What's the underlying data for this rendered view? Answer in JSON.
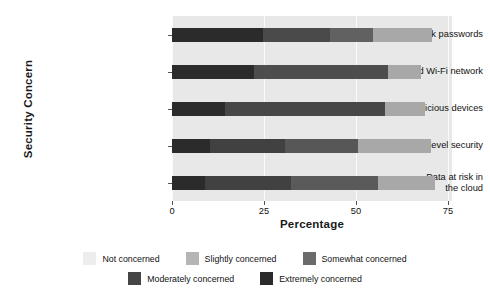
{
  "chart_data": {
    "type": "bar",
    "orientation": "horizontal",
    "stacked": true,
    "title": "",
    "xlabel": "Percentage",
    "ylabel": "Security Concern",
    "categories": [
      "Weak passwords",
      "Unsecured Wi-Fi network",
      "Malicious devices",
      "Lack of transport-level security",
      "Data at risk in\nthe cloud"
    ],
    "xlim": [
      -2,
      78
    ],
    "xticks": [
      0,
      25,
      50,
      75
    ],
    "xtick_labels": [
      "0",
      "25",
      "50",
      "75"
    ],
    "grid": true,
    "legend_position": "bottom",
    "series": [
      {
        "name": "Extremely concerned",
        "color": "#2b2b2b",
        "values": [
          24.7,
          22.3,
          14.4,
          10.3,
          9.0
        ]
      },
      {
        "name": "Moderately concerned",
        "color": "#4a4a4a",
        "values": [
          18.2,
          36.4,
          43.5,
          20.4,
          23.4
        ]
      },
      {
        "name": "Somewhat concerned",
        "color": "#6e6e6e",
        "values": [
          11.7,
          0.0,
          0.0,
          19.8,
          23.6
        ]
      },
      {
        "name": "Slightly concerned",
        "color": "#a8a8a8",
        "values": [
          16.0,
          9.0,
          10.9,
          19.8,
          15.5
        ]
      },
      {
        "name": "Not concerned",
        "color": "#ededed",
        "values": [
          0.0,
          0.0,
          0.0,
          0.0,
          0.0
        ]
      }
    ],
    "bars": [
      {
        "category": "Weak passwords",
        "segments": [
          {
            "name": "Extremely concerned",
            "value": 24.7,
            "color": "#2b2b2b"
          },
          {
            "name": "Moderately concerned",
            "value": 18.2,
            "color": "#4a4a4a"
          },
          {
            "name": "Somewhat concerned",
            "value": 11.7,
            "color": "#616161"
          },
          {
            "name": "Slightly concerned",
            "value": 16.0,
            "color": "#a8a8a8"
          }
        ]
      },
      {
        "category": "Unsecured Wi-Fi network",
        "segments": [
          {
            "name": "Extremely concerned",
            "value": 22.3,
            "color": "#2b2b2b"
          },
          {
            "name": "Moderately concerned",
            "value": 36.4,
            "color": "#4d4d4d"
          },
          {
            "name": "Slightly concerned",
            "value": 9.0,
            "color": "#a8a8a8"
          }
        ]
      },
      {
        "category": "Malicious devices",
        "segments": [
          {
            "name": "Extremely concerned",
            "value": 14.4,
            "color": "#2b2b2b"
          },
          {
            "name": "Moderately concerned",
            "value": 43.5,
            "color": "#474747"
          },
          {
            "name": "Slightly concerned",
            "value": 10.9,
            "color": "#a8a8a8"
          }
        ]
      },
      {
        "category": "Lack of transport-level security",
        "segments": [
          {
            "name": "Extremely concerned",
            "value": 10.3,
            "color": "#2b2b2b"
          },
          {
            "name": "Moderately concerned",
            "value": 20.4,
            "color": "#414141"
          },
          {
            "name": "Somewhat concerned",
            "value": 19.8,
            "color": "#575757"
          },
          {
            "name": "Slightly concerned",
            "value": 19.8,
            "color": "#a8a8a8"
          }
        ]
      },
      {
        "category": "Data at risk in the cloud",
        "segments": [
          {
            "name": "Extremely concerned",
            "value": 9.0,
            "color": "#2b2b2b"
          },
          {
            "name": "Moderately concerned",
            "value": 23.4,
            "color": "#414141"
          },
          {
            "name": "Somewhat concerned",
            "value": 23.6,
            "color": "#5a5a5a"
          },
          {
            "name": "Slightly concerned",
            "value": 15.5,
            "color": "#a8a8a8"
          }
        ]
      }
    ],
    "legend": [
      {
        "label": "Not concerned",
        "color": "#ededed"
      },
      {
        "label": "Slightly concerned",
        "color": "#b5b5b5"
      },
      {
        "label": "Somewhat concerned",
        "color": "#6b6b6b"
      },
      {
        "label": "Moderately concerned",
        "color": "#454545"
      },
      {
        "label": "Extremely concerned",
        "color": "#2b2b2b"
      }
    ],
    "plot_background": "#e8e8e8",
    "gridline_color": "#fafafa"
  }
}
